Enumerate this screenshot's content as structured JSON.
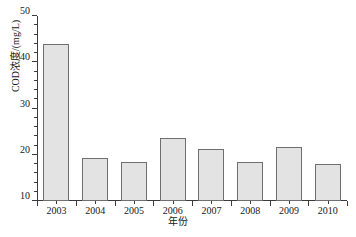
{
  "chart_data": {
    "type": "bar",
    "title": "",
    "xlabel": "年份",
    "ylabel": "COD浓度/(mg/L)",
    "categories": [
      "2003",
      "2004",
      "2005",
      "2006",
      "2007",
      "2008",
      "2009",
      "2010"
    ],
    "values": [
      44.0,
      19.2,
      18.5,
      23.6,
      21.3,
      18.5,
      21.7,
      18.1
    ],
    "ylim": [
      10,
      50
    ],
    "y_major_ticks": [
      10,
      20,
      30,
      40,
      50
    ],
    "y_tick_labels": [
      "10",
      "20",
      "30",
      "40",
      "50"
    ],
    "y_minor_tick_step": 2,
    "grid": false,
    "legend": "none",
    "bar_fill_color": "#e3e3e3",
    "bar_edge_color": "#6f6f6f",
    "axis_color": "#3b3b3b",
    "background_color": "#ffffff"
  }
}
